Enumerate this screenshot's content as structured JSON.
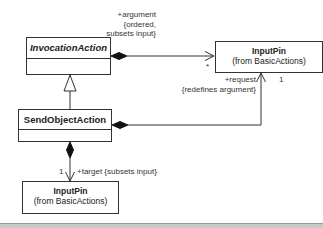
{
  "diagram": {
    "classes": {
      "invocation_action": {
        "name": "InvocationAction",
        "abstract": true
      },
      "send_object_action": {
        "name": "SendObjectAction",
        "abstract": false
      },
      "input_pin_right": {
        "name": "InputPin",
        "package": "(from BasicActions)"
      },
      "input_pin_bottom": {
        "name": "InputPin",
        "package": "(from BasicActions)"
      }
    },
    "associations": {
      "argument": {
        "role": "+argument",
        "constraint_line1": "{ordered,",
        "constraint_line2": "subsets input}",
        "multiplicity": "*"
      },
      "request": {
        "role": "+request",
        "constraint": "{redefines argument}",
        "multiplicity": "1"
      },
      "target": {
        "multiplicity": "1",
        "role_constraint": "+target {subsets input}"
      }
    },
    "generalization": {
      "from": "SendObjectAction",
      "to": "InvocationAction"
    }
  }
}
